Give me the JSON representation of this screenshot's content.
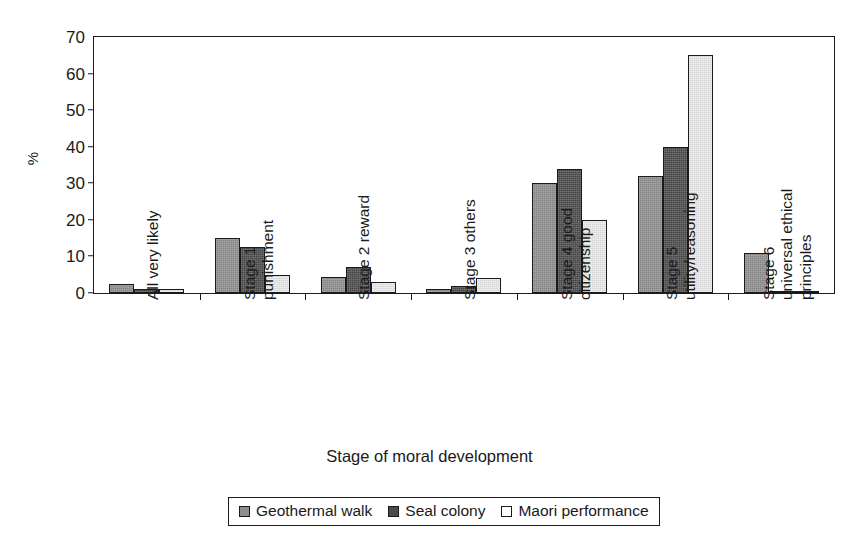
{
  "chart_data": {
    "type": "bar",
    "title": "",
    "xlabel": "Stage of moral development",
    "ylabel": "%",
    "ylim": [
      0,
      70
    ],
    "yticks": [
      0,
      10,
      20,
      30,
      40,
      50,
      60,
      70
    ],
    "grid": false,
    "legend_position": "bottom",
    "categories": [
      "All very likely",
      "Stage 1 punishment",
      "Stage 2 reward",
      "Stage 3 others",
      "Stage 4 good citizenship",
      "Stage 5 utility/reasoning",
      "Stage 6 universal ethical principles"
    ],
    "category_lines": [
      [
        "All very likely"
      ],
      [
        "Stage 1",
        "punishment"
      ],
      [
        "Stage 2 reward"
      ],
      [
        "Stage 3 others"
      ],
      [
        "Stage 4 good",
        "citizenship"
      ],
      [
        "Stage 5",
        "utility/reasoning"
      ],
      [
        "Stage 6",
        "universal ethical",
        "principles"
      ]
    ],
    "series": [
      {
        "name": "Geothermal walk",
        "color": "#8f8f8f",
        "values": [
          2.5,
          15,
          4.5,
          1,
          30,
          32,
          11
        ]
      },
      {
        "name": "Seal colony",
        "color": "#4b4b4b",
        "values": [
          1,
          12.5,
          7,
          2,
          34,
          40,
          0.5
        ]
      },
      {
        "name": "Maori performance",
        "color": "#ececec",
        "values": [
          1,
          5,
          3,
          4,
          20,
          65,
          0.3
        ]
      }
    ]
  }
}
